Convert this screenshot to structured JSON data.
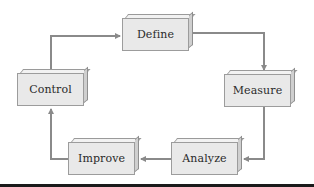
{
  "diagram": {
    "type": "cycle",
    "title": "",
    "nodes": [
      {
        "id": "define",
        "label": "Define",
        "x": 122,
        "y": 18
      },
      {
        "id": "measure",
        "label": "Measure",
        "x": 224,
        "y": 74
      },
      {
        "id": "analyze",
        "label": "Analyze",
        "x": 171,
        "y": 142
      },
      {
        "id": "improve",
        "label": "Improve",
        "x": 68,
        "y": 142
      },
      {
        "id": "control",
        "label": "Control",
        "x": 17,
        "y": 73
      }
    ],
    "edges": [
      {
        "from": "define",
        "to": "measure"
      },
      {
        "from": "measure",
        "to": "analyze"
      },
      {
        "from": "analyze",
        "to": "improve"
      },
      {
        "from": "improve",
        "to": "control"
      },
      {
        "from": "control",
        "to": "define"
      }
    ],
    "colors": {
      "box_front": "#e9e9e9",
      "box_top": "#f2f2f2",
      "box_side": "#cfcfcf",
      "box_border": "#9c9c9c",
      "arrow": "#8a8a8a",
      "text": "#2a2a2a",
      "rule": "#1a1a1a"
    }
  }
}
